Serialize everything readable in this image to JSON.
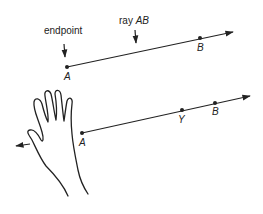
{
  "diagram": {
    "top": {
      "label_endpoint": "endpoint",
      "label_ray_prefix": "ray ",
      "label_ray_name": "AB",
      "point_a": "A",
      "point_b": "B"
    },
    "bottom": {
      "point_a": "A",
      "point_y": "Y",
      "point_b": "B"
    },
    "colors": {
      "stroke": "#222222",
      "background": "#ffffff"
    }
  }
}
